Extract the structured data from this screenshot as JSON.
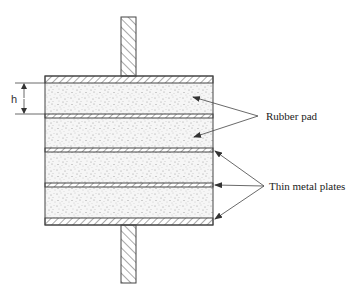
{
  "diagram": {
    "type": "laminated rubber bearing cross-section",
    "labels": {
      "dimension": "h",
      "rubber_pad": "Rubber pad",
      "thin_metal_plates": "Thin metal plates"
    },
    "components": {
      "end_plates": 2,
      "intermediate_thin_plates": 3,
      "rubber_layers": 4,
      "rods": 2
    },
    "colors": {
      "line": "#444444",
      "rubber_fill": "#f4f4f4",
      "speckle": "#9a9a9a",
      "background": "#ffffff"
    }
  }
}
